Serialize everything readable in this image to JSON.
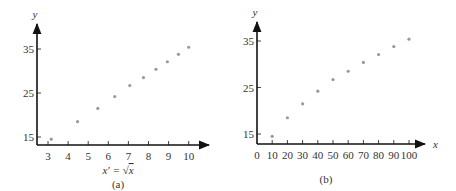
{
  "chart_data": [
    {
      "type": "scatter",
      "panel_label": "(a)",
      "title": "",
      "xlabel": "x' = √x",
      "ylabel": "y",
      "x_ticks": [
        3,
        4,
        5,
        6,
        7,
        8,
        9,
        10
      ],
      "y_ticks": [
        15,
        25,
        35
      ],
      "xlim": [
        2.45,
        11
      ],
      "ylim": [
        13.5,
        40
      ],
      "grid": false,
      "x": [
        3.16,
        4.47,
        5.48,
        6.32,
        7.07,
        7.75,
        8.37,
        8.94,
        9.49,
        10.0
      ],
      "y": [
        14.5,
        18.5,
        21.5,
        24.2,
        26.7,
        28.5,
        30.4,
        32.1,
        33.8,
        35.4
      ]
    },
    {
      "type": "scatter",
      "panel_label": "(b)",
      "title": "",
      "xlabel": "x",
      "ylabel": "y",
      "x_ticks": [
        0,
        10,
        20,
        30,
        40,
        50,
        60,
        70,
        80,
        90,
        100
      ],
      "y_ticks": [
        15,
        25,
        35
      ],
      "xlim": [
        0,
        110
      ],
      "ylim": [
        13.5,
        40
      ],
      "grid": false,
      "x": [
        10,
        20,
        30,
        40,
        50,
        60,
        70,
        80,
        90,
        100
      ],
      "y": [
        14.5,
        18.5,
        21.5,
        24.2,
        26.7,
        28.5,
        30.4,
        32.1,
        33.8,
        35.4
      ]
    }
  ],
  "panels": {
    "a": {
      "caption": "(a)",
      "xlabel_prefix": "x′ =",
      "xlabel_var": "x",
      "ylabel": "y"
    },
    "b": {
      "caption": "(b)",
      "xlabel": "x",
      "ylabel": "y"
    }
  },
  "colors": {
    "axis": "#111111",
    "point": "#999999",
    "text": "#333333"
  }
}
